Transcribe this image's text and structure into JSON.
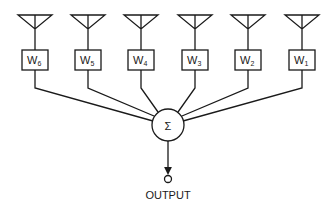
{
  "diagram": {
    "type": "adaptive antenna array beamformer",
    "elements": [
      {
        "id": "w6",
        "weight_label": "W",
        "subscript": "6",
        "x": 35
      },
      {
        "id": "w5",
        "weight_label": "W",
        "subscript": "5",
        "x": 88
      },
      {
        "id": "w4",
        "weight_label": "W",
        "subscript": "4",
        "x": 141
      },
      {
        "id": "w3",
        "weight_label": "W",
        "subscript": "3",
        "x": 195
      },
      {
        "id": "w2",
        "weight_label": "W",
        "subscript": "2",
        "x": 248
      },
      {
        "id": "w1",
        "weight_label": "W",
        "subscript": "1",
        "x": 302
      }
    ],
    "summer": {
      "symbol": "Σ",
      "cx": 168,
      "cy": 125,
      "r": 16
    },
    "output": {
      "label": "OUTPUT"
    },
    "colors": {
      "line": "#1a1a1a",
      "background": "#ffffff"
    }
  }
}
